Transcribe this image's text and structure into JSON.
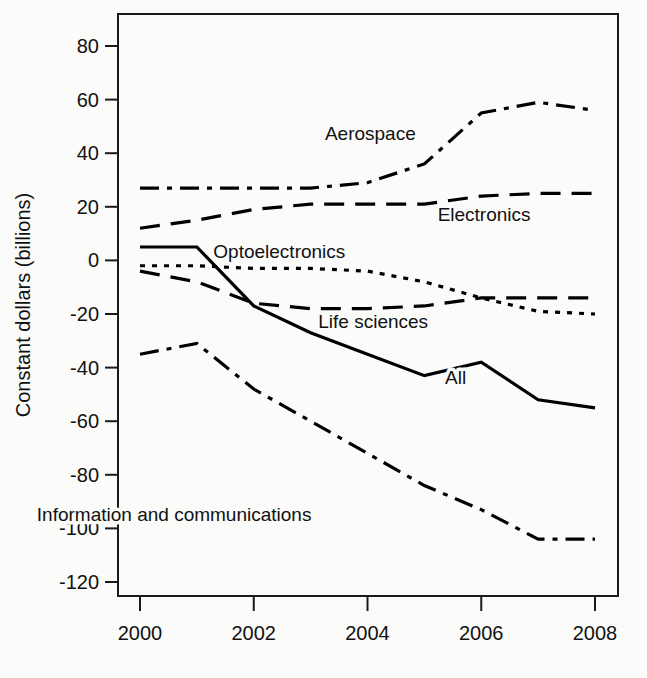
{
  "chart_data": {
    "type": "line",
    "title": "",
    "xlabel": "",
    "ylabel": "Constant dollars (billions)",
    "x": [
      2000,
      2001,
      2002,
      2003,
      2004,
      2005,
      2006,
      2007,
      2008
    ],
    "xticks": [
      "2000",
      "2002",
      "2004",
      "2006",
      "2008"
    ],
    "xtick_values": [
      2000,
      2002,
      2004,
      2006,
      2008
    ],
    "yticks": [
      "80",
      "60",
      "40",
      "20",
      "0",
      "-20",
      "-40",
      "-60",
      "-80",
      "-100",
      "-120"
    ],
    "ytick_values": [
      80,
      60,
      40,
      20,
      0,
      -20,
      -40,
      -60,
      -80,
      -100,
      -120
    ],
    "xlim": [
      2000,
      2008
    ],
    "ylim": [
      -120,
      80
    ],
    "grid": false,
    "legend_position": "inline-annotations",
    "series": [
      {
        "name": "Aerospace",
        "dash": "dash-dot",
        "label_x": 2004.05,
        "label_y": 47,
        "values": [
          27,
          27,
          27,
          27,
          29,
          36,
          55,
          59,
          56
        ]
      },
      {
        "name": "Electronics",
        "dash": "long-dash",
        "label_x": 2006.05,
        "label_y": 17,
        "values": [
          12,
          15,
          19,
          21,
          21,
          21,
          24,
          25,
          25
        ]
      },
      {
        "name": "Optoelectronics",
        "dash": "dotted",
        "label_x": 2002.45,
        "label_y": 3,
        "values": [
          -2,
          -2,
          -3,
          -3,
          -4,
          -8,
          -14,
          -19,
          -20
        ]
      },
      {
        "name": "Life sciences",
        "dash": "long-dash",
        "label_x": 2004.1,
        "label_y": -23,
        "values": [
          -4,
          -8,
          -16,
          -18,
          -18,
          -17,
          -14,
          -14,
          -14
        ]
      },
      {
        "name": "All",
        "dash": "solid",
        "label_x": 2005.55,
        "label_y": -44,
        "values": [
          5,
          5,
          -17,
          -27,
          -35,
          -43,
          -38,
          -52,
          -55
        ]
      },
      {
        "name": "Information and communications",
        "dash": "dash-dot",
        "label_x": 2000.6,
        "label_y": -95,
        "values": [
          -35,
          -31,
          -48,
          -60,
          -72,
          -84,
          -93,
          -104,
          -104
        ]
      }
    ]
  },
  "axis": {
    "y_title": "Constant dollars (billions)"
  }
}
